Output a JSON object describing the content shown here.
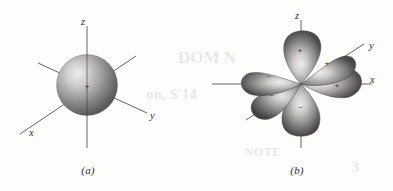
{
  "figure": {
    "background_color": "#fdfdfc",
    "axis_color": "#4a4a4a",
    "lobe_dark": "#4c4a4b",
    "lobe_light": "#e8e6e4",
    "text_color": "#2e2e2e"
  },
  "panels": [
    {
      "id": "a",
      "caption": "(a)",
      "orbital_type": "s-orbital",
      "description": "Spherical s orbital with single positive phase",
      "center": {
        "x": 87,
        "y": 85
      },
      "radius": 30,
      "axes": [
        {
          "name": "z",
          "label": "z",
          "label_x": 81,
          "label_y": 22
        },
        {
          "name": "y",
          "label": "y",
          "label_x": 150,
          "label_y": 116
        },
        {
          "name": "x",
          "label": "x",
          "label_x": 29,
          "label_y": 132
        }
      ],
      "signs": [
        {
          "symbol": "+",
          "x": 87,
          "y": 85
        }
      ]
    },
    {
      "id": "b",
      "caption": "(b)",
      "orbital_type": "d-orbital",
      "description": "Four-lobed d orbital with alternating phases",
      "center": {
        "x": 301,
        "y": 84
      },
      "axes": [
        {
          "name": "z",
          "label": "z",
          "label_x": 295,
          "label_y": 16
        },
        {
          "name": "y",
          "label": "y",
          "label_x": 369,
          "label_y": 46
        },
        {
          "name": "x",
          "label": "x",
          "label_x": 370,
          "label_y": 79
        }
      ],
      "lobes": [
        {
          "name": "top-lobe",
          "sign": "+",
          "sign_x": 300,
          "sign_y": 50,
          "direction": "up"
        },
        {
          "name": "bottom-lobe",
          "sign": "−",
          "sign_x": 301,
          "sign_y": 107,
          "direction": "down"
        },
        {
          "name": "upper-left-lobe",
          "sign": "−",
          "sign_x": 269,
          "sign_y": 75,
          "direction": "upper-left"
        },
        {
          "name": "lower-left-lobe",
          "sign": "−",
          "sign_x": 272,
          "sign_y": 94,
          "direction": "lower-left"
        },
        {
          "name": "upper-right-lobe",
          "sign": "+",
          "sign_x": 327,
          "sign_y": 62,
          "direction": "upper-right"
        },
        {
          "name": "lower-right-lobe",
          "sign": "+",
          "sign_x": 337,
          "sign_y": 84,
          "direction": "lower-right"
        }
      ]
    }
  ],
  "showthrough": [
    {
      "text": "DOM N",
      "x": 178,
      "y": 58,
      "size": 17
    },
    {
      "text": "on, S'14",
      "x": 146,
      "y": 94,
      "size": 15
    },
    {
      "text": "NOTE",
      "x": 244,
      "y": 151,
      "size": 13
    },
    {
      "text": "3",
      "x": 352,
      "y": 168,
      "size": 14
    }
  ]
}
